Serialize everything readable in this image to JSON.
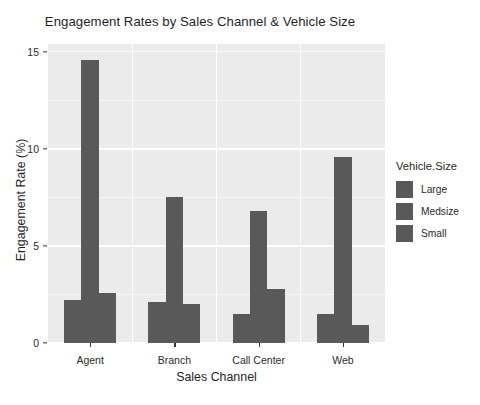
{
  "chart_data": {
    "type": "bar",
    "title": "Engagement Rates by Sales Channel & Vehicle Size",
    "xlabel": "Sales Channel",
    "ylabel": "Engagement Rate (%)",
    "categories": [
      "Agent",
      "Branch",
      "Call Center",
      "Web"
    ],
    "ylim": [
      0,
      15.4
    ],
    "yticks": [
      0,
      5,
      10,
      15
    ],
    "ytick_labels": [
      "0",
      "5",
      "10",
      "15"
    ],
    "grid": true,
    "legend_position": "right",
    "legend_title": "Vehicle.Size",
    "series": [
      {
        "name": "Large",
        "color": "#595959",
        "values": [
          2.2,
          2.1,
          1.5,
          1.5
        ]
      },
      {
        "name": "Medsize",
        "color": "#595959",
        "values": [
          14.6,
          7.5,
          6.8,
          9.6
        ]
      },
      {
        "name": "Small",
        "color": "#595959",
        "values": [
          2.6,
          2.0,
          2.8,
          0.95
        ]
      }
    ],
    "panel_background": "#ebebeb",
    "gridline_color": "#ffffff",
    "bar_color": "#595959"
  }
}
